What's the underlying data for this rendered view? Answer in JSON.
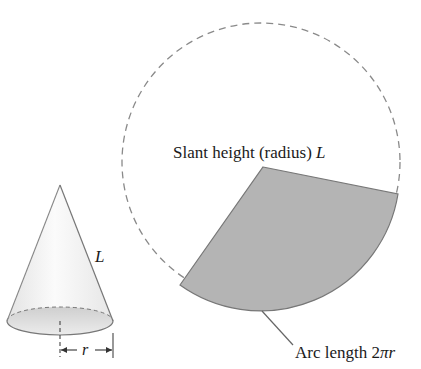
{
  "figure": {
    "labels": {
      "slant_height": "Slant height (radius) ",
      "slant_height_var": "L",
      "cone_L": "L",
      "radius": "r",
      "arc_length": "Arc length 2",
      "arc_pi": "π",
      "arc_r": "r"
    },
    "colors": {
      "sector_fill": "#b4b4b4",
      "outline": "#777777",
      "dashed_circle": "#8a8a8a",
      "cone_fill": "#f2f2f2",
      "base_fill": "#dcdcdc",
      "text": "#1a1a1a"
    }
  }
}
